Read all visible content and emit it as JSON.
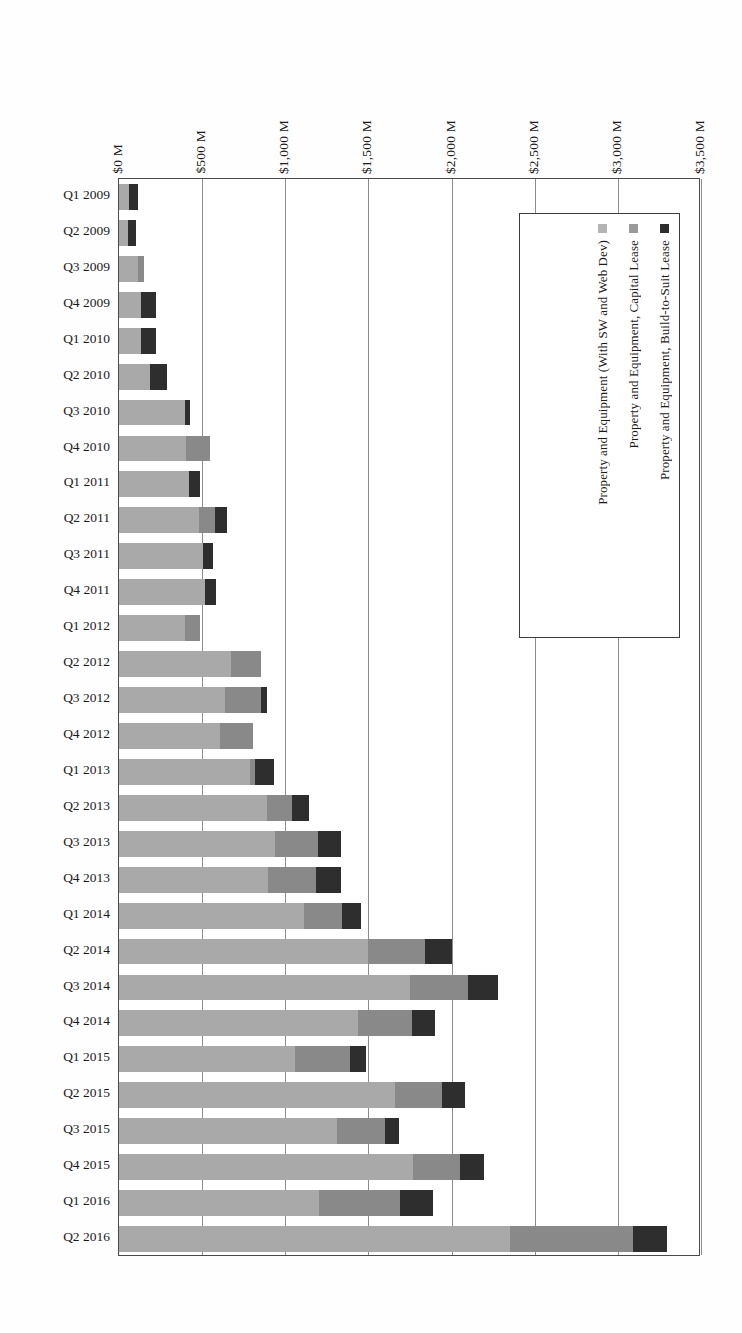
{
  "chart_data": {
    "type": "bar",
    "orientation": "horizontal-rotated",
    "title": "",
    "subtitle": "",
    "xlabel": "",
    "ylabel": "",
    "stacked": true,
    "grid": true,
    "legend_position": "inside-top-right",
    "axis_ticks": [
      "$0 M",
      "$500 M",
      "$1,000 M",
      "$1,500 M",
      "$2,000 M",
      "$2,500 M",
      "$3,000 M",
      "$3,500 M"
    ],
    "axis_tick_values": [
      0,
      500,
      1000,
      1500,
      2000,
      2500,
      3000,
      3500
    ],
    "xlim": [
      0,
      3500
    ],
    "categories": [
      "Q1 2009",
      "Q2 2009",
      "Q3 2009",
      "Q4  2009",
      "Q1 2010",
      "Q2 2010",
      "Q3 2010",
      "Q4  2010",
      "Q1 2011",
      "Q2 2011",
      "Q3 2011",
      "Q4  2011",
      "Q1 2012",
      "Q2 2012",
      "Q3 2012",
      "Q4  2012",
      "Q1 2013",
      "Q2 2013",
      "Q3 2013",
      "Q4  2013",
      "Q1 2014",
      "Q2 2014",
      "Q3 2014",
      "Q4  2014",
      "Q1 2015",
      "Q2 2015",
      "Q3 2015",
      "Q4  2015",
      "Q1 2016",
      "Q2 2016"
    ],
    "series": [
      {
        "name": "Property and Equipment (With SW and Web Dev)",
        "color": "#a9a9a9",
        "values": [
          60,
          55,
          115,
          130,
          135,
          185,
          395,
          400,
          420,
          480,
          505,
          520,
          395,
          675,
          640,
          610,
          790,
          890,
          940,
          895,
          1110,
          1500,
          1750,
          1440,
          1060,
          1660,
          1310,
          1770,
          1200,
          2350
        ]
      },
      {
        "name": "Property and Equipment, Capital Lease",
        "color": "#898989",
        "values": [
          0,
          0,
          35,
          0,
          0,
          0,
          0,
          145,
          0,
          100,
          0,
          0,
          95,
          180,
          215,
          195,
          30,
          150,
          255,
          290,
          230,
          340,
          350,
          320,
          330,
          280,
          290,
          280,
          490,
          740
        ]
      },
      {
        "name": "Property and Equipment, Build-to-Suit Lease",
        "color": "#2e2e2e",
        "values": [
          55,
          50,
          0,
          90,
          85,
          105,
          30,
          0,
          70,
          70,
          60,
          65,
          0,
          0,
          35,
          0,
          110,
          100,
          140,
          150,
          115,
          160,
          180,
          140,
          95,
          140,
          85,
          145,
          200,
          205
        ]
      }
    ],
    "totals": [
      115,
      105,
      150,
      220,
      220,
      290,
      425,
      545,
      490,
      650,
      565,
      585,
      490,
      855,
      890,
      805,
      930,
      1140,
      1335,
      1335,
      1455,
      2000,
      2280,
      1900,
      1485,
      2080,
      1685,
      2195,
      1890,
      3295
    ]
  },
  "legend": {
    "items": [
      {
        "label": "Property and Equipment, Build-to-Suit Lease",
        "swatch": "build"
      },
      {
        "label": "Property and Equipment, Capital Lease",
        "swatch": "capital"
      },
      {
        "label": "Property and Equipment (With SW and Web Dev)",
        "swatch": "base"
      }
    ]
  }
}
